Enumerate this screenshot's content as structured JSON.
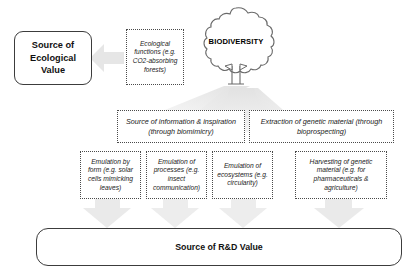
{
  "diagram": {
    "title_nodes": {
      "ecological_value": "Source of\nEcological\nValue",
      "rd_value": "Source of R&D Value"
    },
    "center_icon": {
      "name": "tree-icon",
      "label": "BIODIVERSITY"
    },
    "ecological_branch": {
      "functions": "Ecological functions (e.g. CO2-absorbing forests)"
    },
    "rd_branches": [
      {
        "id": "information-inspiration",
        "label": "Source of information & inspiration (through biomimicry)",
        "children": [
          {
            "id": "emulation-by-form",
            "label": "Emulation by form (e.g. solar cells mimicking leaves)"
          },
          {
            "id": "emulation-of-processes",
            "label": "Emulation of processes (e.g. insect communication)"
          },
          {
            "id": "emulation-of-ecosystems",
            "label": "Emulation of ecosystems (e.g. circularity)"
          }
        ]
      },
      {
        "id": "genetic-material-extraction",
        "label": "Extraction of genetic material (through bioprospecting)",
        "children": [
          {
            "id": "harvesting-genetic-material",
            "label": "Harvesting of genetic material (e.g. for pharmaceuticals & agriculture)"
          }
        ]
      }
    ],
    "colors": {
      "arrow_fill": "#e8e8e8",
      "arrow_fill_light": "#f0f0f0",
      "box_border": "#3c3c3c",
      "dotted_border": "#4a4a4a",
      "text": "#111111",
      "background": "#ffffff"
    }
  }
}
